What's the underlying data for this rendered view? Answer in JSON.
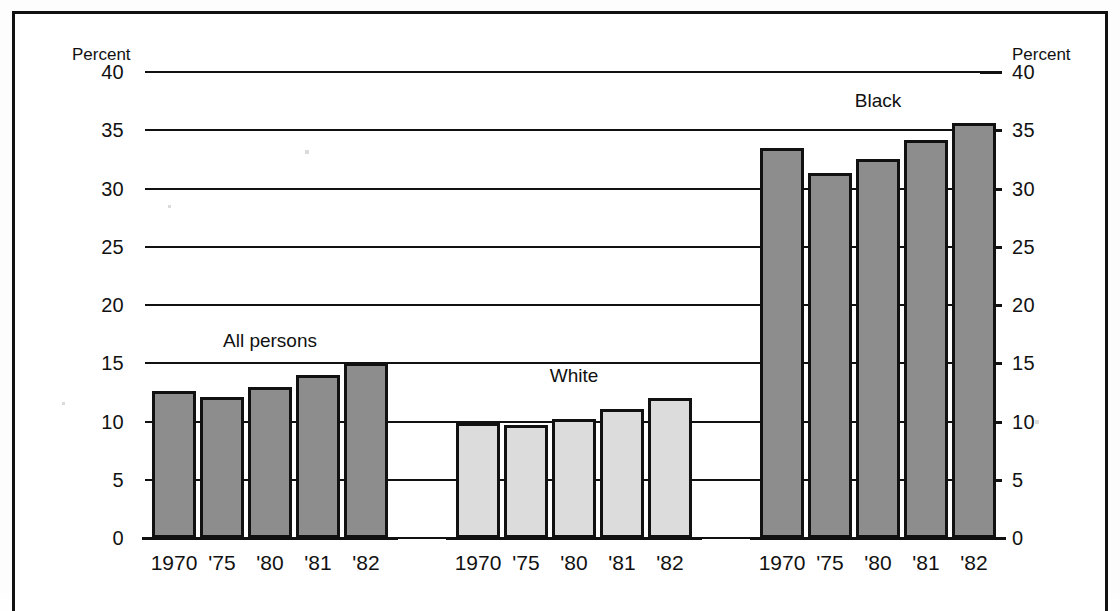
{
  "axis": {
    "caption_left": "Percent",
    "caption_right": "Percent",
    "ticks": [
      "40",
      "35",
      "30",
      "25",
      "20",
      "15",
      "10",
      "5",
      "0"
    ]
  },
  "groups": [
    {
      "label": "All persons",
      "shade": "dark",
      "categories": [
        "1970",
        "'75",
        "'80",
        "'81",
        "'82"
      ],
      "values": [
        12.6,
        12.1,
        13.0,
        14.0,
        15.0
      ]
    },
    {
      "label": "White",
      "shade": "light",
      "categories": [
        "1970",
        "'75",
        "'80",
        "'81",
        "'82"
      ],
      "values": [
        9.9,
        9.7,
        10.2,
        11.1,
        12.0
      ]
    },
    {
      "label": "Black",
      "shade": "dark",
      "categories": [
        "1970",
        "'75",
        "'80",
        "'81",
        "'82"
      ],
      "values": [
        33.5,
        31.3,
        32.5,
        34.2,
        35.6
      ]
    }
  ],
  "chart_data": {
    "type": "bar",
    "title": "",
    "subtitle": "",
    "xlabel": "",
    "ylabel": "Percent",
    "ylim": [
      0,
      40
    ],
    "yticks": [
      0,
      5,
      10,
      15,
      20,
      25,
      30,
      35,
      40
    ],
    "grid": true,
    "legend": "inline-group-labels",
    "categories": [
      "1970",
      "'75",
      "'80",
      "'81",
      "'82"
    ],
    "series": [
      {
        "name": "All persons",
        "values": [
          12.6,
          12.1,
          13.0,
          14.0,
          15.0
        ],
        "color": "#8d8d8d"
      },
      {
        "name": "White",
        "values": [
          9.9,
          9.7,
          10.2,
          11.1,
          12.0
        ],
        "color": "#dcdcdc"
      },
      {
        "name": "Black",
        "values": [
          33.5,
          31.3,
          32.5,
          34.2,
          35.6
        ],
        "color": "#8d8d8d"
      }
    ],
    "annotations": [
      "All persons",
      "White",
      "Black"
    ]
  },
  "colors": {
    "dark_bar": "#8d8d8d",
    "light_bar": "#dcdcdc",
    "ink": "#111111"
  }
}
